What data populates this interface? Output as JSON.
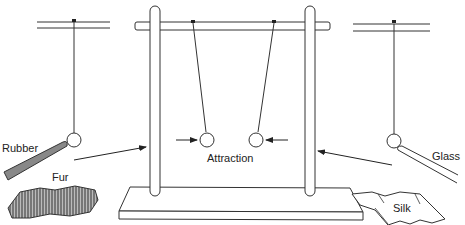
{
  "diagram": {
    "labels": {
      "rubber": "Rubber",
      "fur": "Fur",
      "attraction": "Attraction",
      "glass": "Glass",
      "silk": "Silk"
    },
    "colors": {
      "line": "#333333",
      "rubber_fill": "#777777",
      "fur_fill": "#8a8a8a",
      "background": "#ffffff"
    },
    "parts": [
      {
        "name": "left-suspension",
        "description": "Pith ball on thread near rubber rod charged with fur"
      },
      {
        "name": "center-stand",
        "description": "Wooden stand with two pith balls attracting each other"
      },
      {
        "name": "right-suspension",
        "description": "Pith ball on thread near glass rod charged with silk"
      }
    ]
  }
}
